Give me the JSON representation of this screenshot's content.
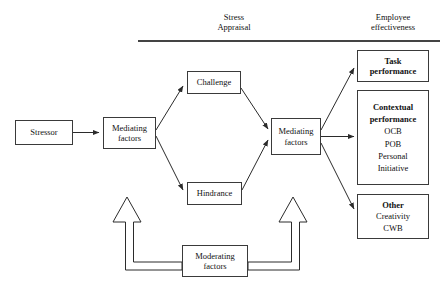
{
  "figure": {
    "width": 444,
    "height": 292,
    "colors": {
      "background": "#ffffff",
      "stroke": "#3a3a3a",
      "divider": "#444444",
      "text": "#111111"
    }
  },
  "headers": {
    "stress": {
      "line1": "Stress",
      "line2": "Appraisal"
    },
    "employee": {
      "line1": "Employee",
      "line2": "effectiveness"
    }
  },
  "nodes": {
    "stressor": {
      "line1": "Stressor"
    },
    "mediating_1": {
      "line1": "Mediating",
      "line2": "factors"
    },
    "challenge": {
      "line1": "Challenge"
    },
    "hindrance": {
      "line1": "Hindrance"
    },
    "mediating_2": {
      "line1": "Mediating",
      "line2": "factors"
    },
    "moderating": {
      "line1": "Moderating",
      "line2": "factors"
    },
    "task": {
      "line1": "Task",
      "line2": "performance"
    },
    "contextual": {
      "line1": "Contextual",
      "line2": "performance",
      "item1": "OCB",
      "item2": "POB",
      "item3": "Personal",
      "item4": "Initiative"
    },
    "other": {
      "line1": "Other",
      "item1": "Creativity",
      "item2": "CWB"
    }
  },
  "connectors": [
    {
      "name": "stressor-to-mediating-1",
      "type": "solid-arrow",
      "from": "stressor",
      "to": "mediating_1"
    },
    {
      "name": "mediating-1-to-challenge",
      "type": "solid-arrow",
      "from": "mediating_1",
      "to": "challenge"
    },
    {
      "name": "mediating-1-to-hindrance",
      "type": "solid-arrow",
      "from": "mediating_1",
      "to": "hindrance"
    },
    {
      "name": "challenge-to-mediating-2",
      "type": "solid-arrow",
      "from": "challenge",
      "to": "mediating_2"
    },
    {
      "name": "hindrance-to-mediating-2",
      "type": "solid-arrow",
      "from": "hindrance",
      "to": "mediating_2"
    },
    {
      "name": "mediating-2-to-task",
      "type": "solid-arrow",
      "from": "mediating_2",
      "to": "task"
    },
    {
      "name": "mediating-2-to-contextual",
      "type": "solid-arrow",
      "from": "mediating_2",
      "to": "contextual"
    },
    {
      "name": "mediating-2-to-other",
      "type": "solid-arrow",
      "from": "mediating_2",
      "to": "other"
    },
    {
      "name": "moderating-to-left-path",
      "type": "hollow-block-arrow",
      "from": "moderating",
      "to": "mediating_1_branch"
    },
    {
      "name": "moderating-to-right-path",
      "type": "hollow-block-arrow",
      "from": "moderating",
      "to": "mediating_2_branch"
    }
  ]
}
